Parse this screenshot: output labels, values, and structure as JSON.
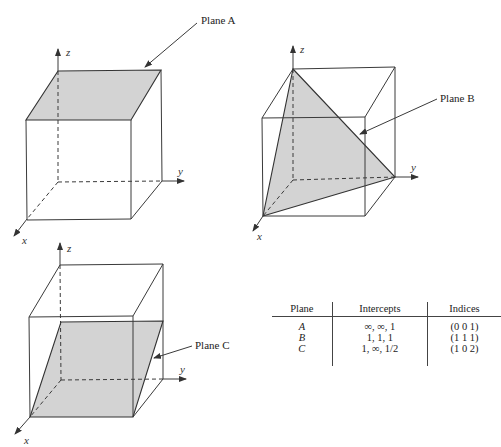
{
  "figure": {
    "cube_a": {
      "label": "Plane A",
      "axes": {
        "x": "x",
        "y": "y",
        "z": "z"
      }
    },
    "cube_b": {
      "label": "Plane B",
      "axes": {
        "x": "x",
        "y": "y",
        "z": "z"
      }
    },
    "cube_c": {
      "label": "Plane C",
      "axes": {
        "x": "x",
        "y": "y",
        "z": "z"
      }
    },
    "colors": {
      "plane_fill": "#d3d3d3",
      "line": "#3a3a3a"
    }
  },
  "table": {
    "headers": [
      "Plane",
      "Intercepts",
      "Indices"
    ],
    "rows": [
      {
        "plane": "A",
        "intercepts": "∞, ∞, 1",
        "indices": "(0 0 1)"
      },
      {
        "plane": "B",
        "intercepts": "1, 1, 1",
        "indices": "(1 1 1)"
      },
      {
        "plane": "C",
        "intercepts": "1, ∞, 1/2",
        "indices": "(1 0 2)"
      }
    ]
  }
}
